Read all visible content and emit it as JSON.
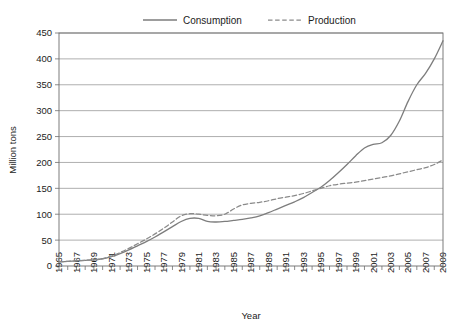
{
  "chart_data": {
    "type": "line",
    "title": "",
    "xlabel": "Year",
    "ylabel": "Million tons",
    "xlim": [
      1965,
      2009
    ],
    "ylim": [
      0,
      450
    ],
    "grid": true,
    "legend_position": "top",
    "y_ticks": [
      0,
      50,
      100,
      150,
      200,
      250,
      300,
      350,
      400,
      450
    ],
    "y_tick_labels": [
      "0",
      "50",
      "100",
      "150",
      "200",
      "250",
      "300",
      "350",
      "400",
      "450"
    ],
    "x_ticks": [
      1965,
      1966,
      1967,
      1968,
      1969,
      1970,
      1971,
      1972,
      1973,
      1974,
      1975,
      1976,
      1977,
      1978,
      1979,
      1980,
      1981,
      1982,
      1983,
      1984,
      1985,
      1986,
      1987,
      1988,
      1989,
      1990,
      1991,
      1992,
      1993,
      1994,
      1995,
      1996,
      1997,
      1998,
      1999,
      2000,
      2001,
      2002,
      2003,
      2004,
      2005,
      2006,
      2007,
      2008,
      2009
    ],
    "x_tick_labels": [
      "1965",
      "1967",
      "1969",
      "1971",
      "1973",
      "1975",
      "1977",
      "1979",
      "1981",
      "1983",
      "1985",
      "1987",
      "1989",
      "1991",
      "1993",
      "1995",
      "1997",
      "1999",
      "2001",
      "2003",
      "2005",
      "2007",
      "2009"
    ],
    "x_labeled_years": [
      1965,
      1967,
      1969,
      1971,
      1973,
      1975,
      1977,
      1979,
      1981,
      1983,
      1985,
      1987,
      1989,
      1991,
      1993,
      1995,
      1997,
      1999,
      2001,
      2003,
      2005,
      2007,
      2009
    ],
    "x": [
      1965,
      1966,
      1967,
      1968,
      1969,
      1970,
      1971,
      1972,
      1973,
      1974,
      1975,
      1976,
      1977,
      1978,
      1979,
      1980,
      1981,
      1982,
      1983,
      1984,
      1985,
      1986,
      1987,
      1988,
      1989,
      1990,
      1991,
      1992,
      1993,
      1994,
      1995,
      1996,
      1997,
      1998,
      1999,
      2000,
      2001,
      2002,
      2003,
      2004,
      2005,
      2006,
      2007,
      2008,
      2009
    ],
    "series": [
      {
        "name": "Consumption",
        "style": "solid",
        "color": "#7d7d7d",
        "values": [
          8,
          9,
          10,
          11,
          12,
          14,
          18,
          24,
          31,
          39,
          47,
          56,
          66,
          76,
          86,
          92,
          92,
          86,
          85,
          86,
          88,
          90,
          93,
          97,
          103,
          110,
          117,
          124,
          132,
          142,
          152,
          165,
          180,
          196,
          213,
          228,
          235,
          238,
          252,
          280,
          318,
          350,
          372,
          400,
          435
        ]
      },
      {
        "name": "Production",
        "style": "dashed",
        "color": "#8a8a8a",
        "values": [
          8,
          9,
          10,
          11,
          12,
          14,
          19,
          26,
          34,
          43,
          52,
          62,
          73,
          85,
          97,
          101,
          100,
          98,
          97,
          100,
          110,
          118,
          121,
          123,
          126,
          130,
          133,
          136,
          140,
          145,
          150,
          155,
          158,
          160,
          162,
          165,
          168,
          171,
          174,
          178,
          182,
          186,
          190,
          196,
          205
        ]
      }
    ]
  }
}
